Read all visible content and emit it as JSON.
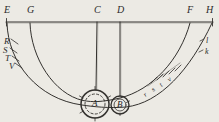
{
  "figure": {
    "kind": "hand-drawn-geometric-diagram",
    "medium": "pen-on-aged-paper",
    "paper_color": "#eceae4",
    "ink_color": "#2b2b2b",
    "width": 219,
    "height": 122,
    "baseline": {
      "label": "horizontal-baseline",
      "y": 22,
      "x_start": 6,
      "x_end": 213
    },
    "baseline_points": [
      {
        "id": "E",
        "label": "E",
        "x": 7,
        "label_x": 4,
        "label_y": 5
      },
      {
        "id": "G",
        "label": "G",
        "x": 30,
        "label_x": 27,
        "label_y": 5
      },
      {
        "id": "C",
        "label": "C",
        "x": 97,
        "label_x": 94,
        "label_y": 5
      },
      {
        "id": "D",
        "label": "D",
        "x": 120,
        "label_x": 117,
        "label_y": 5
      },
      {
        "id": "F",
        "label": "F",
        "x": 190,
        "label_x": 187,
        "label_y": 5
      },
      {
        "id": "H",
        "label": "H",
        "x": 212,
        "label_x": 207,
        "label_y": 5
      }
    ],
    "arcs": [
      {
        "name": "inner-arc",
        "from": "G",
        "to": "F"
      },
      {
        "name": "outer-arc",
        "from": "E",
        "to": "H"
      }
    ],
    "verticals": [
      {
        "name": "vertical-line-c-to-a",
        "from": "C",
        "to": "A"
      },
      {
        "name": "vertical-line-d-to-b",
        "from": "D",
        "to": "B"
      }
    ],
    "circles": [
      {
        "id": "A",
        "label": "A",
        "name": "circle-a",
        "cx": 95,
        "cy": 104,
        "r_outer": 14,
        "r_inner": 10,
        "inner_style": "dashed"
      },
      {
        "id": "B",
        "label": "B",
        "name": "circle-b",
        "cx": 120,
        "cy": 105,
        "r_outer": 9,
        "r_inner": 6,
        "inner_style": "solid"
      }
    ],
    "left_tick_labels": [
      {
        "label": "R",
        "x": 4,
        "y": 42
      },
      {
        "label": "S",
        "x": 3,
        "y": 51
      },
      {
        "label": "T",
        "x": 5,
        "y": 59
      },
      {
        "label": "V",
        "x": 9,
        "y": 66
      }
    ],
    "right_edge_labels": [
      {
        "label": "l",
        "x": 205,
        "y": 42
      },
      {
        "label": "k",
        "x": 205,
        "y": 53
      }
    ],
    "right_tick_labels": [
      {
        "label": "r",
        "x": 148,
        "y": 79
      },
      {
        "label": "s",
        "x": 157,
        "y": 74
      },
      {
        "label": "t",
        "x": 165,
        "y": 69
      },
      {
        "label": "v",
        "x": 173,
        "y": 64
      }
    ]
  }
}
